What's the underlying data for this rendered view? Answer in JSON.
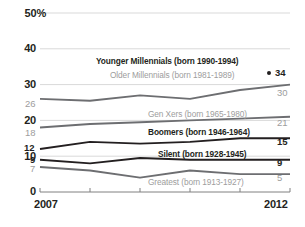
{
  "chart_data": {
    "type": "line",
    "title": "",
    "xlabel": "",
    "ylabel": "",
    "x": [
      2007,
      2008,
      2009,
      2010,
      2011,
      2012
    ],
    "xtick_labels": [
      "2007",
      "",
      "",
      "",
      "",
      "2012"
    ],
    "ytick_labels": [
      "0",
      "10",
      "20",
      "30",
      "40",
      "50%"
    ],
    "yticks": [
      0,
      10,
      20,
      30,
      40,
      50
    ],
    "ylim": [
      0,
      50
    ],
    "grid": true,
    "legend": "inline-labels",
    "series": [
      {
        "name": "Younger Millennials (born 1990-1994)",
        "label": "Younger Millennials (born 1990-1994)",
        "color": "#231f20",
        "emphasis": "dark",
        "values": [
          null,
          null,
          null,
          null,
          null,
          34
        ],
        "start_label": "",
        "end_label": "34",
        "marker": "dot"
      },
      {
        "name": "Older Millennials (born 1981-1989)",
        "label": "Older Millennials (born 1981-1989)",
        "color": "#6d6e71",
        "emphasis": "gray",
        "values": [
          26,
          25.5,
          27,
          26,
          28.5,
          30
        ],
        "start_label": "26",
        "end_label": "30",
        "marker": "none"
      },
      {
        "name": "Gen Xers (born 1965-1980)",
        "label": "Gen Xers (born 1965-1980)",
        "color": "#6d6e71",
        "emphasis": "gray",
        "values": [
          18,
          19,
          19.5,
          20,
          20.5,
          21
        ],
        "start_label": "18",
        "end_label": "21",
        "marker": "none"
      },
      {
        "name": "Boomers (born 1946-1964)",
        "label": "Boomers (born 1946-1964)",
        "color": "#231f20",
        "emphasis": "dark",
        "values": [
          12,
          14,
          13.5,
          14,
          15,
          15
        ],
        "start_label": "12",
        "end_label": "15",
        "marker": "none"
      },
      {
        "name": "Silent (born 1928-1945)",
        "label": "Silent (born 1928-1945)",
        "color": "#231f20",
        "emphasis": "dark",
        "values": [
          9,
          8,
          9.5,
          9,
          9,
          9
        ],
        "start_label": "9",
        "end_label": "9",
        "marker": "none"
      },
      {
        "name": "Greatest (born 1913-1927)",
        "label": "Greatest (born 1913-1927)",
        "color": "#6d6e71",
        "emphasis": "gray",
        "values": [
          7,
          6,
          4,
          6,
          5,
          5
        ],
        "start_label": "7",
        "end_label": "5",
        "marker": "none"
      }
    ],
    "colors": {
      "dark": "#231f20",
      "gray": "#6d6e71",
      "label_gray": "#9d9d9d",
      "gridline": "#d9d9d9",
      "axis": "#808080",
      "background": "#ffffff"
    }
  },
  "axis": {
    "y": {
      "t50": "50%",
      "t40": "40",
      "t30": "30",
      "t20": "20",
      "t10": "10",
      "t0": "0"
    },
    "x": {
      "first": "2007",
      "last": "2012"
    }
  },
  "series_labels": {
    "younger_millennials": "Younger Millennials (born 1990-1994)",
    "older_millennials": "Older Millennials (born 1981-1989)",
    "gen_xers": "Gen Xers (born 1965-1980)",
    "boomers": "Boomers (born 1946-1964)",
    "silent": "Silent (born 1928-1945)",
    "greatest": "Greatest (born 1913-1927)"
  },
  "value_labels": {
    "younger_millennials_end": "34",
    "older_millennials_start": "26",
    "older_millennials_end": "30",
    "gen_xers_start": "18",
    "gen_xers_end": "21",
    "boomers_start": "12",
    "boomers_end": "15",
    "silent_start": "9",
    "silent_end": "9",
    "greatest_start": "7",
    "greatest_end": "5"
  }
}
